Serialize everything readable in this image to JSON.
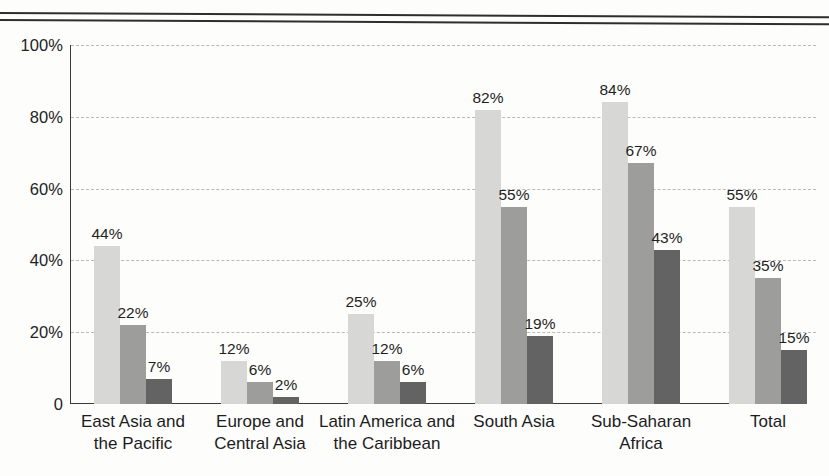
{
  "chart_data": {
    "type": "bar",
    "title": "",
    "xlabel": "",
    "ylabel": "",
    "ylim": [
      0,
      100
    ],
    "yticks": [
      "0",
      "20%",
      "40%",
      "60%",
      "80%",
      "100%"
    ],
    "ytick_values": [
      0,
      20,
      40,
      60,
      80,
      100
    ],
    "grid": true,
    "legend": "none",
    "categories": [
      "East Asia and the Pacific",
      "Europe and Central Asia",
      "Latin America and the Caribbean",
      "South Asia",
      "Sub-Saharan Africa",
      "Total"
    ],
    "category_lines": [
      [
        "East Asia and",
        "the Pacific"
      ],
      [
        "Europe and",
        "Central Asia"
      ],
      [
        "Latin America and",
        "the Caribbean"
      ],
      [
        "South Asia",
        ""
      ],
      [
        "Sub-Saharan",
        "Africa"
      ],
      [
        "Total",
        ""
      ]
    ],
    "series": [
      {
        "name": "series-1",
        "color": "#d7d7d5",
        "values": [
          44,
          12,
          25,
          82,
          84,
          55
        ],
        "labels": [
          "44%",
          "12%",
          "25%",
          "82%",
          "84%",
          "55%"
        ]
      },
      {
        "name": "series-2",
        "color": "#9d9d9c",
        "values": [
          22,
          6,
          12,
          55,
          67,
          35
        ],
        "labels": [
          "22%",
          "6%",
          "12%",
          "55%",
          "67%",
          "35%"
        ]
      },
      {
        "name": "series-3",
        "color": "#636363",
        "values": [
          7,
          2,
          6,
          19,
          43,
          15
        ],
        "labels": [
          "7%",
          "2%",
          "6%",
          "19%",
          "43%",
          "15%"
        ]
      }
    ]
  },
  "layout": {
    "group_left_px": [
      23,
      150,
      277,
      404,
      531,
      658
    ],
    "bar_width_px": 26,
    "bar_gap_px": 0,
    "px_per_percent": 3.59
  }
}
